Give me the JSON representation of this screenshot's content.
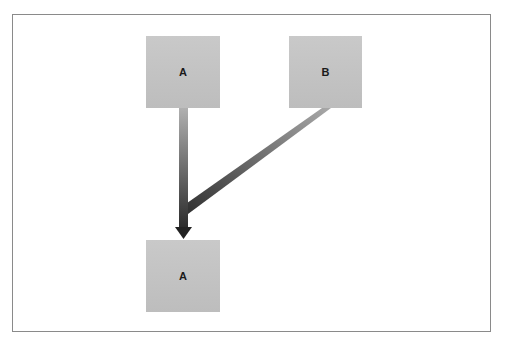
{
  "diagram": {
    "nodes": [
      {
        "id": "a-top",
        "label": "A"
      },
      {
        "id": "b-top",
        "label": "B"
      },
      {
        "id": "a-bottom",
        "label": "A"
      }
    ],
    "edges": [
      {
        "from": "a-top",
        "to": "a-bottom",
        "style": "gradient-arrow"
      },
      {
        "from": "b-top",
        "to": "a-bottom",
        "style": "gradient-line-merge"
      }
    ],
    "colors": {
      "node_fill": "#c4c4c4",
      "edge_dark": "#2b2b2b",
      "edge_light": "#a8a8a8",
      "frame_border": "#8a8a8a"
    }
  }
}
